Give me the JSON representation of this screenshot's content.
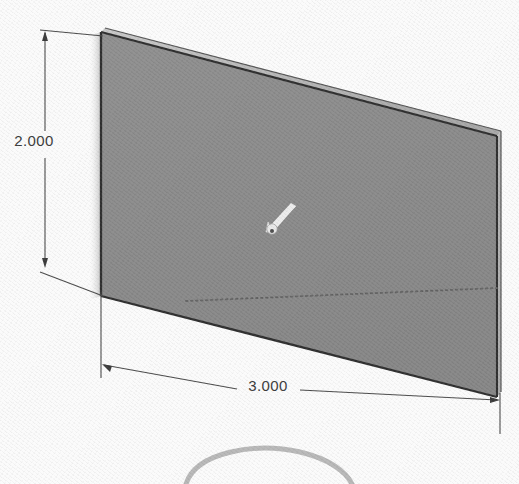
{
  "drawing": {
    "title": "Isometric rectangular plate with dimensions",
    "background_color": "#fbfbfb",
    "face_color": "#8a8a8a",
    "edge_color": "#2e2e2e",
    "thickness_color": "#b9b9b9",
    "dimension_color": "#4a4a4a",
    "hidden_line_color": "#6d6d6d",
    "cursor_color": "#f2f2f2"
  },
  "dimensions": {
    "height": {
      "label": "2.000",
      "orientation": "vertical",
      "position": "left",
      "text_x": 34,
      "text_y": 146
    },
    "width": {
      "label": "3.000",
      "orientation": "horizontal",
      "position": "bottom",
      "text_x": 268,
      "text_y": 391
    }
  },
  "annotations": {
    "cursor_icon": "arrow-pointer",
    "hidden_edge": "dotted-hidden-line",
    "partial_arc": "background-arc"
  }
}
